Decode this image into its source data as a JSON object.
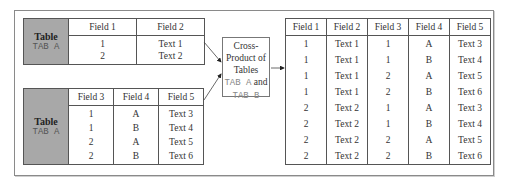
{
  "table_a": {
    "label_title": "Table",
    "label_name": "TAB A",
    "headers": [
      "Field 1",
      "Field 2"
    ],
    "columns": [
      [
        "1",
        "2"
      ],
      [
        "Text 1",
        "Text 2"
      ]
    ]
  },
  "table_b": {
    "label_title": "Table",
    "label_name": "TAB A",
    "headers": [
      "Field 3",
      "Field 4",
      "Field 5"
    ],
    "rows": [
      [
        "1",
        "A",
        "Text 3"
      ],
      [
        "1",
        "B",
        "Text 4"
      ],
      [
        "2",
        "A",
        "Text 5"
      ],
      [
        "2",
        "B",
        "Text 6"
      ]
    ]
  },
  "cross_product": {
    "line1": "Cross-",
    "line2": "Product of",
    "line3": "Tables",
    "tab_a": "TAB A",
    "and": "and",
    "tab_b": "TAB B"
  },
  "result": {
    "headers": [
      "Field 1",
      "Field 2",
      "Field 3",
      "Field 4",
      "Field 5"
    ],
    "rows": [
      [
        "1",
        "Text 1",
        "1",
        "A",
        "Text 3"
      ],
      [
        "1",
        "Text 1",
        "1",
        "B",
        "Text 4"
      ],
      [
        "1",
        "Text 1",
        "2",
        "A",
        "Text 5"
      ],
      [
        "1",
        "Text 1",
        "2",
        "B",
        "Text 6"
      ],
      [
        "2",
        "Text 2",
        "1",
        "A",
        "Text 3"
      ],
      [
        "2",
        "Text 2",
        "1",
        "B",
        "Text 4"
      ],
      [
        "2",
        "Text 2",
        "2",
        "A",
        "Text 5"
      ],
      [
        "2",
        "Text 2",
        "2",
        "B",
        "Text 6"
      ]
    ]
  }
}
